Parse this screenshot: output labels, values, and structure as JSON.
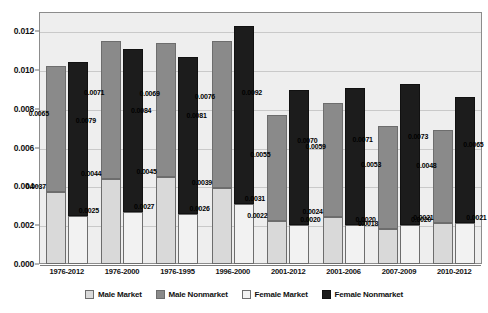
{
  "chart_data": {
    "type": "bar",
    "title": "",
    "xlabel": "",
    "ylabel": "",
    "ylim": [
      0,
      0.013
    ],
    "yticks": [
      "0.000",
      "0.002",
      "0.004",
      "0.006",
      "0.008",
      "0.010",
      "0.012"
    ],
    "ytick_values": [
      0,
      0.002,
      0.004,
      0.006,
      0.008,
      0.01,
      0.012
    ],
    "grid": true,
    "stacked": true,
    "legend_position": "bottom",
    "categories": [
      "1976-2012",
      "1976-2000",
      "1976-1995",
      "1996-2000",
      "2001-2012",
      "2001-2006",
      "2007-2009",
      "2010-2012"
    ],
    "series": [
      {
        "name": "Male Market",
        "color": "#d9d9d9",
        "values": [
          0.0037,
          0.0044,
          0.0045,
          0.0039,
          0.0022,
          0.0024,
          0.0018,
          0.0021
        ],
        "labels": [
          "0.0037",
          "0.0044",
          "0.0045",
          "0.0039",
          "0.0022",
          "0.0024",
          "0.0018",
          "0.0021"
        ]
      },
      {
        "name": "Male Nonmarket",
        "color": "#8a8a8a",
        "values": [
          0.0065,
          0.0071,
          0.0069,
          0.0076,
          0.0055,
          0.0059,
          0.0053,
          0.0048
        ],
        "labels": [
          "0.0065",
          "0.0071",
          "0.0069",
          "0.0076",
          "0.0055",
          "0.0059",
          "0.0053",
          "0.0048"
        ]
      },
      {
        "name": "Female Market",
        "color": "#f2f2f2",
        "values": [
          0.0025,
          0.0027,
          0.0026,
          0.0031,
          0.002,
          0.002,
          0.002,
          0.0021
        ],
        "labels": [
          "0.0025",
          "0.0027",
          "0.0026",
          "0.0031",
          "0.0020",
          "0.0020",
          "0.0020",
          "0.0021"
        ]
      },
      {
        "name": "Female Nonmarket",
        "color": "#1c1c1c",
        "values": [
          0.0079,
          0.0084,
          0.0081,
          0.0092,
          0.007,
          0.0071,
          0.0073,
          0.0065
        ],
        "labels": [
          "0.0079",
          "0.0084",
          "0.0081",
          "0.0092",
          "0.0070",
          "0.0071",
          "0.0073",
          "0.0065"
        ]
      }
    ],
    "totals": {
      "male": [
        0.0102,
        0.0115,
        0.0114,
        0.0115,
        0.0077,
        0.0083,
        0.0071,
        0.0069
      ],
      "female": [
        0.0104,
        0.0111,
        0.0107,
        0.0123,
        0.009,
        0.0091,
        0.0093,
        0.0086
      ]
    }
  },
  "legend": {
    "items": [
      {
        "label": "Male Market"
      },
      {
        "label": "Male Nonmarket"
      },
      {
        "label": "Female Market"
      },
      {
        "label": "Female Nonmarket"
      }
    ]
  }
}
